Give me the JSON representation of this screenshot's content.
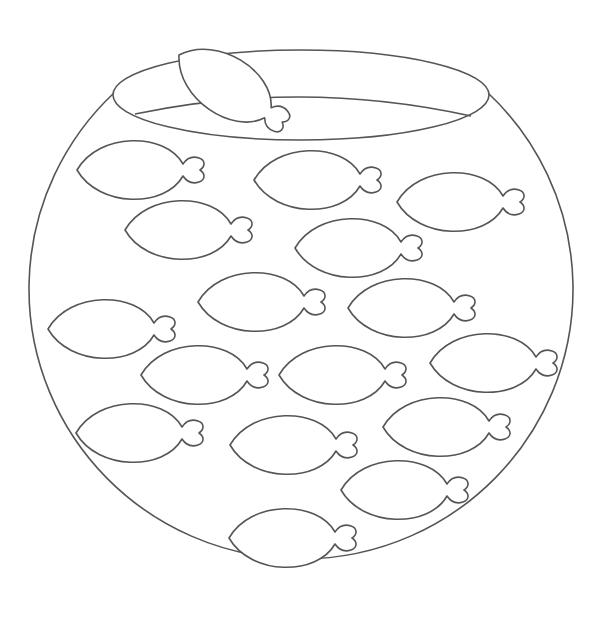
{
  "image": {
    "subject": "Fish bowl coloring page",
    "description": "Line drawing of a round fish bowl containing 16 fish outlines, with one fish peeking over the rim",
    "stroke_color": "#555555",
    "background_color": "#ffffff"
  },
  "bowl": {
    "body": {
      "cx": 300,
      "cy": 318,
      "rx": 272,
      "ry": 270
    },
    "rim": {
      "cx": 301,
      "cy": 95,
      "rx": 188,
      "ry": 45
    },
    "water_line": {
      "x1": 135,
      "y1": 114,
      "x2": 471,
      "y2": 116,
      "peak_y": 97
    }
  },
  "rim_fish": {
    "x": 179,
    "y": 55,
    "rotate": 33
  },
  "fish": [
    {
      "x": 77,
      "y": 170
    },
    {
      "x": 254,
      "y": 180
    },
    {
      "x": 397,
      "y": 202
    },
    {
      "x": 125,
      "y": 230
    },
    {
      "x": 295,
      "y": 248
    },
    {
      "x": 198,
      "y": 302
    },
    {
      "x": 348,
      "y": 308
    },
    {
      "x": 48,
      "y": 329
    },
    {
      "x": 141,
      "y": 375
    },
    {
      "x": 279,
      "y": 375
    },
    {
      "x": 430,
      "y": 363
    },
    {
      "x": 76,
      "y": 433
    },
    {
      "x": 230,
      "y": 445
    },
    {
      "x": 383,
      "y": 427
    },
    {
      "x": 341,
      "y": 490
    },
    {
      "x": 229,
      "y": 538
    }
  ]
}
